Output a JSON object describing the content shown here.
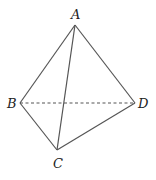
{
  "diagram": {
    "type": "tetrahedron",
    "stroke_color": "#555555",
    "vertices": {
      "A": {
        "label": "A",
        "x": 75,
        "y": 25
      },
      "B": {
        "label": "B",
        "x": 20,
        "y": 103
      },
      "C": {
        "label": "C",
        "x": 57,
        "y": 150
      },
      "D": {
        "label": "D",
        "x": 135,
        "y": 103
      }
    },
    "edges": [
      {
        "from": "A",
        "to": "B",
        "style": "solid"
      },
      {
        "from": "A",
        "to": "C",
        "style": "solid"
      },
      {
        "from": "A",
        "to": "D",
        "style": "solid"
      },
      {
        "from": "B",
        "to": "C",
        "style": "solid"
      },
      {
        "from": "C",
        "to": "D",
        "style": "solid"
      },
      {
        "from": "B",
        "to": "D",
        "style": "dashed"
      }
    ]
  }
}
